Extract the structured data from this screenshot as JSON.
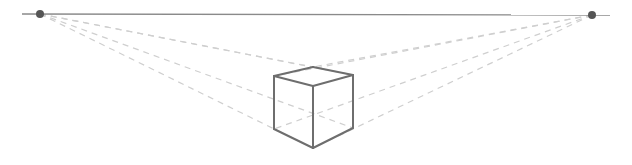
{
  "diagram": {
    "width": 632,
    "height": 165,
    "colors": {
      "background": "#ffffff",
      "horizon": "#8a8a8a",
      "vanishing_point": "#555555",
      "guide": "#cfcfcf",
      "cube_edge": "#6e6e6e"
    },
    "horizon": {
      "x1": 22,
      "y1": 14,
      "x2": 610,
      "y2": 15
    },
    "vanishing_points": [
      {
        "name": "left-vanishing-point",
        "x": 40,
        "y": 14,
        "r": 4
      },
      {
        "name": "right-vanishing-point",
        "x": 592,
        "y": 15,
        "r": 4
      }
    ],
    "cube": {
      "vertices": {
        "back_top": [
          313,
          67
        ],
        "left_top": [
          274,
          76
        ],
        "right_top": [
          353,
          75
        ],
        "front_top": [
          313,
          86
        ],
        "left_bottom": [
          274,
          129
        ],
        "right_bottom": [
          353,
          128
        ],
        "front_bottom": [
          313,
          148
        ]
      },
      "edges": [
        [
          "back_top",
          "left_top"
        ],
        [
          "back_top",
          "right_top"
        ],
        [
          "left_top",
          "front_top"
        ],
        [
          "right_top",
          "front_top"
        ],
        [
          "left_top",
          "left_bottom"
        ],
        [
          "front_top",
          "front_bottom"
        ],
        [
          "right_top",
          "right_bottom"
        ],
        [
          "left_bottom",
          "front_bottom"
        ],
        [
          "right_bottom",
          "front_bottom"
        ]
      ]
    },
    "guides": [
      {
        "from": "left-vanishing-point",
        "to": "back_top"
      },
      {
        "from": "left-vanishing-point",
        "to": "right_top"
      },
      {
        "from": "left-vanishing-point",
        "to": "front_bottom"
      },
      {
        "from": "right-vanishing-point",
        "to": "back_top"
      },
      {
        "from": "right-vanishing-point",
        "to": "left_top"
      },
      {
        "from": "right-vanishing-point",
        "to": "front_bottom"
      },
      {
        "from": "left-vanishing-point",
        "to": "right_bottom"
      },
      {
        "from": "right-vanishing-point",
        "to": "left_bottom"
      }
    ]
  }
}
